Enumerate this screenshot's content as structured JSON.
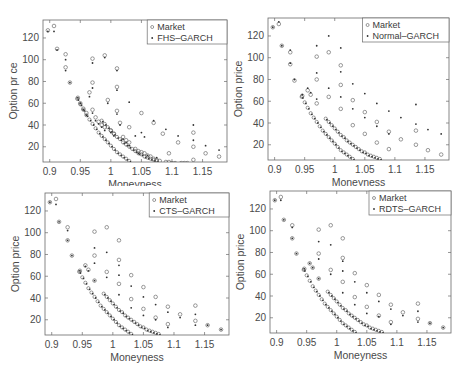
{
  "chart_data": [
    {
      "type": "scatter",
      "title": "",
      "xlabel": "Moneyness",
      "ylabel": "Option pr ce",
      "xlim": [
        0.889,
        1.19
      ],
      "ylim": [
        6,
        136.5
      ],
      "xticks": [
        0.9,
        0.95,
        1,
        1.05,
        1.1,
        1.15
      ],
      "xtick_labels": [
        "0.9",
        "0.95",
        "1",
        "1.05",
        "1.1",
        "1.15"
      ],
      "yticks": [
        20,
        40,
        60,
        80,
        100,
        120
      ],
      "ytick_labels": [
        "20",
        "40",
        "60",
        "80",
        "100",
        "120"
      ],
      "grid": false,
      "legend_position": "upper right",
      "legend": [
        "Market",
        "FHS–GARCH"
      ],
      "series": [
        {
          "name": "Market",
          "marker": "circle",
          "x": [
            0.897,
            0.907,
            0.912,
            0.926,
            0.926,
            0.933,
            0.946,
            0.95,
            0.955,
            0.96,
            0.965,
            0.97,
            0.97,
            0.97,
            0.975,
            0.98,
            0.985,
            0.99,
            0.99,
            0.995,
            1.0,
            1.005,
            1.01,
            1.01,
            1.01,
            1.015,
            1.02,
            1.025,
            1.03,
            1.03,
            1.04,
            1.045,
            1.05,
            1.05,
            1.055,
            1.06,
            1.065,
            1.07,
            1.07,
            1.075,
            1.08,
            1.085,
            1.09,
            1.095,
            1.095,
            1.1,
            1.105,
            1.11,
            1.115,
            1.12,
            1.125,
            1.135,
            1.135,
            1.135,
            1.155,
            1.177,
            1.197
          ],
          "y": [
            127,
            131,
            110,
            105,
            93,
            79,
            65,
            60,
            55,
            51,
            70,
            101,
            79,
            54,
            47,
            43,
            40,
            38,
            104,
            63,
            35,
            32,
            92,
            75,
            53,
            42,
            29,
            26,
            24,
            38,
            18,
            16,
            51,
            15,
            14,
            12,
            11,
            42,
            9,
            8,
            7,
            32,
            6,
            6,
            14,
            5,
            5,
            24,
            5,
            5,
            5,
            33,
            20,
            8,
            14,
            11,
            7
          ]
        },
        {
          "name": "FHS–GARCH",
          "marker": "dot",
          "x": [
            0.897,
            0.907,
            0.912,
            0.926,
            0.926,
            0.933,
            0.946,
            0.95,
            0.955,
            0.96,
            0.965,
            0.97,
            0.97,
            0.97,
            0.975,
            0.98,
            0.985,
            0.99,
            0.99,
            0.995,
            1.0,
            1.005,
            1.01,
            1.01,
            1.01,
            1.015,
            1.02,
            1.025,
            1.03,
            1.03,
            1.04,
            1.045,
            1.05,
            1.055,
            1.06,
            1.07,
            1.075,
            1.09,
            1.11,
            1.135,
            1.135,
            1.155,
            1.177,
            1.197
          ],
          "y": [
            126,
            126,
            109,
            100,
            90,
            79,
            65,
            60,
            54,
            49,
            66,
            97,
            74,
            51,
            44,
            41,
            38,
            35,
            102,
            60,
            33,
            30,
            90,
            72,
            50,
            40,
            27,
            24,
            21,
            61,
            30,
            14,
            33,
            29,
            12,
            44,
            10,
            36,
            30,
            40,
            26,
            21,
            17,
            8
          ]
        }
      ]
    },
    {
      "type": "scatter",
      "title": "",
      "xlabel": "Moneyness",
      "ylabel": "Option price",
      "xlim": [
        0.889,
        1.19
      ],
      "ylim": [
        6,
        136.5
      ],
      "xticks": [
        0.9,
        0.95,
        1,
        1.05,
        1.1,
        1.15
      ],
      "xtick_labels": [
        "0.9",
        "0.95",
        "1",
        "1.05",
        "1.1",
        "1.15"
      ],
      "yticks": [
        20,
        40,
        60,
        80,
        100,
        120
      ],
      "ytick_labels": [
        "20",
        "40",
        "60",
        "80",
        "100",
        "120"
      ],
      "grid": false,
      "legend_position": "upper right",
      "legend": [
        "Market",
        "Normal–GARCH"
      ],
      "series": [
        {
          "name": "Market",
          "marker": "circle",
          "x": [
            0.897,
            0.907,
            0.912,
            0.926,
            0.926,
            0.933,
            0.946,
            0.955,
            0.96,
            0.97,
            0.97,
            0.97,
            0.99,
            0.99,
            1.01,
            1.01,
            1.01,
            1.03,
            1.03,
            1.05,
            1.05,
            1.07,
            1.07,
            1.09,
            1.09,
            1.11,
            1.135,
            1.135,
            1.155,
            1.177,
            1.197
          ],
          "y": [
            128,
            131,
            111,
            105,
            94,
            79,
            65,
            70,
            66,
            101,
            80,
            58,
            105,
            64,
            93,
            75,
            53,
            61,
            38,
            50,
            30,
            41,
            22,
            32,
            16,
            25,
            33,
            20,
            15,
            11,
            9
          ]
        },
        {
          "name": "Normal–GARCH",
          "marker": "dot",
          "x": [
            0.897,
            0.907,
            0.912,
            0.926,
            0.926,
            0.933,
            0.946,
            0.955,
            0.96,
            0.97,
            0.97,
            0.97,
            0.99,
            0.99,
            1.01,
            1.01,
            1.01,
            1.03,
            1.03,
            1.05,
            1.05,
            1.07,
            1.07,
            1.09,
            1.09,
            1.11,
            1.135,
            1.135,
            1.155,
            1.177,
            1.197
          ],
          "y": [
            128,
            133,
            111,
            107,
            95,
            80,
            66,
            72,
            68,
            111,
            86,
            62,
            120,
            72,
            109,
            87,
            64,
            76,
            53,
            67,
            45,
            58,
            37,
            51,
            30,
            45,
            57,
            39,
            34,
            30,
            26
          ]
        }
      ]
    },
    {
      "type": "scatter",
      "title": "",
      "xlabel": "Moneyness",
      "ylabel": "Option price",
      "xlim": [
        0.889,
        1.19
      ],
      "ylim": [
        6,
        136.5
      ],
      "xticks": [
        0.9,
        0.95,
        1,
        1.05,
        1.1,
        1.15
      ],
      "xtick_labels": [
        "0.9",
        "0.95",
        "1",
        "1.05",
        "1.1",
        "1.15"
      ],
      "yticks": [
        20,
        40,
        60,
        80,
        100,
        120
      ],
      "ytick_labels": [
        "20",
        "40",
        "60",
        "80",
        "100",
        "120"
      ],
      "grid": false,
      "legend_position": "upper right",
      "legend": [
        "Market",
        "CTS–GARCH"
      ],
      "series": [
        {
          "name": "Market",
          "marker": "circle",
          "x": [
            0.897,
            0.907,
            0.912,
            0.926,
            0.926,
            0.933,
            0.946,
            0.955,
            0.96,
            0.97,
            0.97,
            0.97,
            0.99,
            0.99,
            1.01,
            1.01,
            1.01,
            1.03,
            1.03,
            1.05,
            1.05,
            1.07,
            1.07,
            1.09,
            1.09,
            1.11,
            1.135,
            1.135,
            1.155,
            1.177,
            1.197
          ],
          "y": [
            128,
            131,
            110,
            105,
            93,
            79,
            65,
            70,
            66,
            101,
            79,
            56,
            105,
            64,
            93,
            75,
            53,
            61,
            39,
            50,
            30,
            41,
            22,
            32,
            16,
            25,
            33,
            19,
            15,
            11,
            9
          ]
        },
        {
          "name": "CTS–GARCH",
          "marker": "dot",
          "x": [
            0.897,
            0.907,
            0.912,
            0.926,
            0.926,
            0.933,
            0.946,
            0.955,
            0.96,
            0.97,
            0.97,
            0.97,
            0.99,
            0.99,
            1.01,
            1.01,
            1.01,
            1.03,
            1.03,
            1.05,
            1.05,
            1.07,
            1.07,
            1.09,
            1.09,
            1.11,
            1.135,
            1.135,
            1.155,
            1.177,
            1.197
          ],
          "y": [
            128,
            126,
            110,
            102,
            93,
            79,
            65,
            69,
            65,
            86,
            72,
            56,
            82,
            59,
            70,
            61,
            43,
            51,
            31,
            41,
            24,
            34,
            20,
            27,
            13,
            22,
            25,
            15,
            15,
            11,
            9
          ]
        }
      ]
    },
    {
      "type": "scatter",
      "title": "",
      "xlabel": "Moneyness",
      "ylabel": "Option price",
      "xlim": [
        0.889,
        1.19
      ],
      "ylim": [
        6,
        136.5
      ],
      "xticks": [
        0.9,
        0.95,
        1,
        1.05,
        1.1,
        1.15
      ],
      "xtick_labels": [
        "0.9",
        "0.95",
        "1",
        "1.05",
        "1.1",
        "1.15"
      ],
      "yticks": [
        20,
        40,
        60,
        80,
        100,
        120
      ],
      "ytick_labels": [
        "20",
        "40",
        "60",
        "80",
        "100",
        "120"
      ],
      "grid": false,
      "legend_position": "upper right",
      "legend": [
        "Market",
        "RDTS–GARCH"
      ],
      "series": [
        {
          "name": "Market",
          "marker": "circle",
          "x": [
            0.897,
            0.907,
            0.912,
            0.926,
            0.926,
            0.933,
            0.946,
            0.955,
            0.96,
            0.97,
            0.97,
            0.97,
            0.99,
            0.99,
            1.01,
            1.01,
            1.01,
            1.03,
            1.03,
            1.05,
            1.05,
            1.07,
            1.07,
            1.09,
            1.09,
            1.11,
            1.135,
            1.135,
            1.155,
            1.177,
            1.197
          ],
          "y": [
            128,
            131,
            110,
            105,
            93,
            79,
            65,
            70,
            66,
            101,
            79,
            56,
            105,
            64,
            93,
            75,
            53,
            61,
            39,
            50,
            30,
            41,
            22,
            32,
            16,
            25,
            33,
            19,
            15,
            11,
            9
          ]
        },
        {
          "name": "RDTS–GARCH",
          "marker": "dot",
          "x": [
            0.897,
            0.907,
            0.912,
            0.926,
            0.926,
            0.933,
            0.946,
            0.955,
            0.96,
            0.97,
            0.97,
            0.97,
            0.99,
            0.99,
            1.01,
            1.01,
            1.01,
            1.03,
            1.03,
            1.05,
            1.05,
            1.07,
            1.07,
            1.09,
            1.09,
            1.11,
            1.135,
            1.135,
            1.155,
            1.177,
            1.197
          ],
          "y": [
            128,
            128,
            110,
            103,
            93,
            79,
            65,
            70,
            66,
            90,
            74,
            56,
            87,
            60,
            72,
            63,
            43,
            53,
            32,
            43,
            24,
            35,
            21,
            28,
            14,
            22,
            26,
            16,
            15,
            11,
            9
          ]
        }
      ]
    }
  ],
  "curves": {
    "note_market_curves": "dense market circle curves and model dot curves",
    "strikes_curve_market": [
      [
        0.945,
        64
      ],
      [
        0.95,
        59
      ],
      [
        0.955,
        54
      ],
      [
        0.96,
        49
      ],
      [
        0.965,
        45
      ],
      [
        0.97,
        41
      ],
      [
        0.975,
        37
      ],
      [
        0.98,
        33
      ],
      [
        0.985,
        30
      ],
      [
        0.99,
        27
      ],
      [
        0.995,
        24
      ],
      [
        1.0,
        21
      ],
      [
        1.005,
        18
      ],
      [
        1.01,
        15
      ],
      [
        1.015,
        13
      ],
      [
        1.02,
        11
      ],
      [
        1.025,
        9
      ],
      [
        1.03,
        7
      ]
    ],
    "strikes_curve_market2": [
      [
        0.985,
        44
      ],
      [
        0.99,
        41
      ],
      [
        0.995,
        38
      ],
      [
        1.0,
        35
      ],
      [
        1.005,
        32
      ],
      [
        1.01,
        29
      ],
      [
        1.015,
        27
      ],
      [
        1.02,
        24
      ],
      [
        1.025,
        22
      ],
      [
        1.03,
        20
      ],
      [
        1.035,
        18
      ],
      [
        1.04,
        16
      ],
      [
        1.045,
        14
      ],
      [
        1.05,
        13
      ],
      [
        1.055,
        11
      ],
      [
        1.06,
        10
      ],
      [
        1.065,
        9
      ],
      [
        1.07,
        8
      ],
      [
        1.075,
        7
      ]
    ]
  },
  "caption": "the market prices of options, and model prices on ... 2008"
}
